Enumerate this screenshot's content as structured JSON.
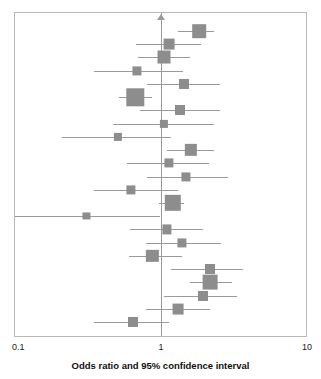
{
  "chart_data": {
    "type": "forest",
    "title": "",
    "xlabel": "Odds ratio and 95% confidence interval",
    "ylabel": "",
    "xscale": "log",
    "xlim": [
      0.1,
      10
    ],
    "xticks": [
      0.1,
      1,
      10
    ],
    "xtick_labels": [
      "0.1",
      "1",
      "10"
    ],
    "grid": false,
    "legend": null,
    "null_line": 1,
    "null_marker": "triangle-up",
    "colors": {
      "marker": "#8d8d8d",
      "line": "#9a9a9a",
      "frame": "#b9b9b9",
      "text": "#111111"
    },
    "categories": [
      "Study 1",
      "Study 2",
      "Study 3",
      "Study 4",
      "Study 5",
      "Study 6",
      "Study 7",
      "Study 8",
      "Study 9",
      "Study 10",
      "Study 11",
      "Study 12",
      "Study 13",
      "Study 14",
      "Study 15",
      "Study 16",
      "Study 17",
      "Study 18",
      "Study 19",
      "Study 20",
      "Study 21",
      "Study 22",
      "Study 23"
    ],
    "points": [
      {
        "or": 1.85,
        "lo": 1.32,
        "hi": 2.34,
        "weight": 11
      },
      {
        "or": 1.15,
        "lo": 0.68,
        "hi": 1.9,
        "weight": 7
      },
      {
        "or": 1.06,
        "lo": 0.7,
        "hi": 1.6,
        "weight": 10
      },
      {
        "or": 0.69,
        "lo": 0.35,
        "hi": 1.42,
        "weight": 5
      },
      {
        "or": 1.45,
        "lo": 0.81,
        "hi": 2.55,
        "weight": 6
      },
      {
        "or": 0.67,
        "lo": 0.52,
        "hi": 0.88,
        "weight": 18
      },
      {
        "or": 1.36,
        "lo": 0.72,
        "hi": 2.55,
        "weight": 6
      },
      {
        "or": 1.06,
        "lo": 0.47,
        "hi": 2.32,
        "weight": 4
      },
      {
        "or": 0.51,
        "lo": 0.21,
        "hi": 1.18,
        "weight": 4
      },
      {
        "or": 1.62,
        "lo": 1.11,
        "hi": 2.32,
        "weight": 9
      },
      {
        "or": 1.15,
        "lo": 0.59,
        "hi": 2.15,
        "weight": 5
      },
      {
        "or": 1.5,
        "lo": 0.81,
        "hi": 2.9,
        "weight": 5
      },
      {
        "or": 0.63,
        "lo": 0.35,
        "hi": 1.32,
        "weight": 5
      },
      {
        "or": 1.22,
        "lo": 0.98,
        "hi": 1.45,
        "weight": 16
      },
      {
        "or": 0.31,
        "lo": 0.1,
        "hi": 0.99,
        "weight": 3
      },
      {
        "or": 1.11,
        "lo": 0.62,
        "hi": 1.95,
        "weight": 5
      },
      {
        "or": 1.4,
        "lo": 0.79,
        "hi": 2.62,
        "weight": 5
      },
      {
        "or": 0.88,
        "lo": 0.61,
        "hi": 1.4,
        "weight": 9
      },
      {
        "or": 2.2,
        "lo": 1.18,
        "hi": 3.7,
        "weight": 6
      },
      {
        "or": 2.2,
        "lo": 1.6,
        "hi": 3.1,
        "weight": 13
      },
      {
        "or": 1.95,
        "lo": 1.05,
        "hi": 3.35,
        "weight": 6
      },
      {
        "or": 1.32,
        "lo": 0.79,
        "hi": 2.2,
        "weight": 7
      },
      {
        "or": 0.65,
        "lo": 0.35,
        "hi": 1.15,
        "weight": 6
      }
    ]
  },
  "axis": {
    "tick_left": "0.1",
    "tick_center": "1",
    "tick_right": "10",
    "title": "Odds ratio and 95% confidence interval"
  }
}
